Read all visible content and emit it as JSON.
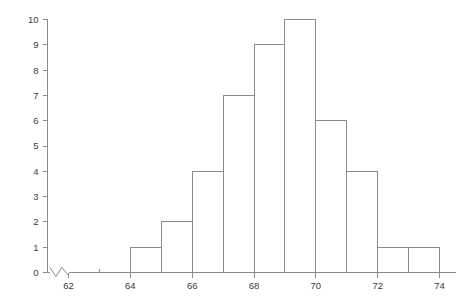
{
  "chart_data": {
    "type": "bar",
    "title": "",
    "subtitle": "",
    "xlabel": "",
    "ylabel": "",
    "grid": false,
    "legend": null,
    "orientation": "vertical",
    "bin_width": 1,
    "bin_edges": [
      64,
      65,
      66,
      67,
      68,
      69,
      70,
      71,
      72,
      73,
      74
    ],
    "categories": [
      "64-65",
      "65-66",
      "66-67",
      "67-68",
      "68-69",
      "69-70",
      "70-71",
      "71-72",
      "72-73",
      "73-74"
    ],
    "values": [
      1,
      2,
      4,
      7,
      9,
      10,
      6,
      4,
      1,
      1
    ],
    "total_count": 45,
    "xlim": [
      61.3,
      74.6
    ],
    "ylim": [
      0,
      10
    ],
    "x_axis": {
      "major_ticks": [
        62,
        64,
        66,
        68,
        70,
        72,
        74
      ],
      "major_tick_labels": [
        "62",
        "64",
        "66",
        "68",
        "70",
        "72",
        "74"
      ],
      "minor_ticks": [
        63,
        65,
        67,
        69,
        71,
        73
      ],
      "axis_break": true,
      "break_range": [
        61.4,
        62.0
      ]
    },
    "y_axis": {
      "major_ticks": [
        0,
        1,
        2,
        3,
        4,
        5,
        6,
        7,
        8,
        9,
        10
      ],
      "major_tick_labels": [
        "0",
        "1",
        "2",
        "3",
        "4",
        "5",
        "6",
        "7",
        "8",
        "9",
        "10"
      ]
    },
    "colors": {
      "bar_fill": "#ffffff",
      "bar_stroke": "#8a8a8a",
      "axis": "#8a8a8a",
      "label_text": "#3a3a3a",
      "background": "#ffffff"
    }
  }
}
